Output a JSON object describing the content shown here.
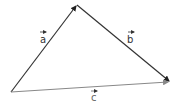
{
  "diagram": {
    "type": "vector-triangle",
    "vertices": {
      "origin": {
        "x": 11,
        "y": 92
      },
      "top": {
        "x": 77,
        "y": 5
      },
      "right": {
        "x": 170,
        "y": 82
      }
    },
    "vectors": [
      {
        "name": "a",
        "label": "a",
        "from": "origin",
        "to": "top",
        "color": "#333333"
      },
      {
        "name": "b",
        "label": "b",
        "from": "top",
        "to": "right",
        "color": "#333333"
      },
      {
        "name": "c",
        "label": "c",
        "from": "origin",
        "to": "right",
        "color": "#888888"
      }
    ],
    "labels": {
      "a": "a",
      "b": "b",
      "c": "c"
    }
  }
}
